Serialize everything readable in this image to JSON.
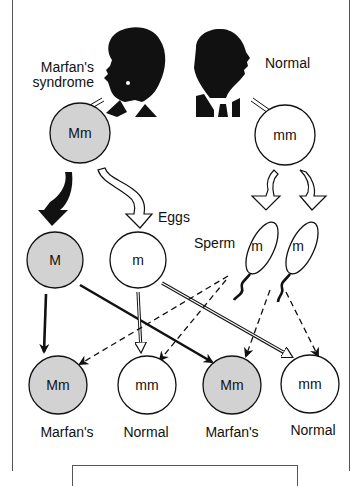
{
  "diagram": {
    "title_labels": {
      "affected_parent": "Marfan's\nsyndrome",
      "affected_parent_line1": "Marfan's",
      "affected_parent_line2": "syndrome",
      "normal_parent": "Normal"
    },
    "colors": {
      "affected_fill": "#d2d2d2",
      "normal_fill": "#ffffff",
      "stroke": "#111111"
    },
    "parents": [
      {
        "id": "affected",
        "genotype": "Mm",
        "affected": true
      },
      {
        "id": "normal",
        "genotype": "mm",
        "affected": false
      }
    ],
    "gametes": {
      "eggs_label": "Eggs",
      "sperm_label": "Sperm",
      "eggs": [
        {
          "allele": "M",
          "affected": true
        },
        {
          "allele": "m",
          "affected": false
        }
      ],
      "sperm": [
        {
          "allele": "m"
        },
        {
          "allele": "m"
        }
      ]
    },
    "offspring": [
      {
        "genotype": "Mm",
        "label": "Marfan's",
        "affected": true
      },
      {
        "genotype": "mm",
        "label": "Normal",
        "affected": false
      },
      {
        "genotype": "Mm",
        "label": "Marfan's",
        "affected": true
      },
      {
        "genotype": "mm",
        "label": "Normal",
        "affected": false
      }
    ]
  }
}
